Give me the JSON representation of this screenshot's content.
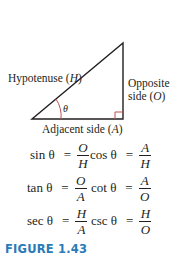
{
  "figure": {
    "labels": {
      "hypotenuse": "Hypotenuse (",
      "hypotenuse_var": "H",
      "hypotenuse_close": ")",
      "opposite_line1": "Opposite",
      "opposite_line2": "side (",
      "opposite_var": "O",
      "opposite_close": ")",
      "adjacent": "Adjacent side (",
      "adjacent_var": "A",
      "adjacent_close": ")",
      "angle": "θ"
    },
    "colors": {
      "line": "#231f20",
      "accent": "#c0504d",
      "caption": "#2a7ab8"
    }
  },
  "equations": [
    {
      "fn": "sin θ",
      "num": "O",
      "den": "H"
    },
    {
      "fn": "cos θ",
      "num": "A",
      "den": "H"
    },
    {
      "fn": "tan θ",
      "num": "O",
      "den": "A"
    },
    {
      "fn": "cot θ",
      "num": "A",
      "den": "O"
    },
    {
      "fn": "sec θ",
      "num": "H",
      "den": "A"
    },
    {
      "fn": "csc θ",
      "num": "H",
      "den": "O"
    }
  ],
  "equals": "=",
  "caption": "FIGURE 1.43"
}
